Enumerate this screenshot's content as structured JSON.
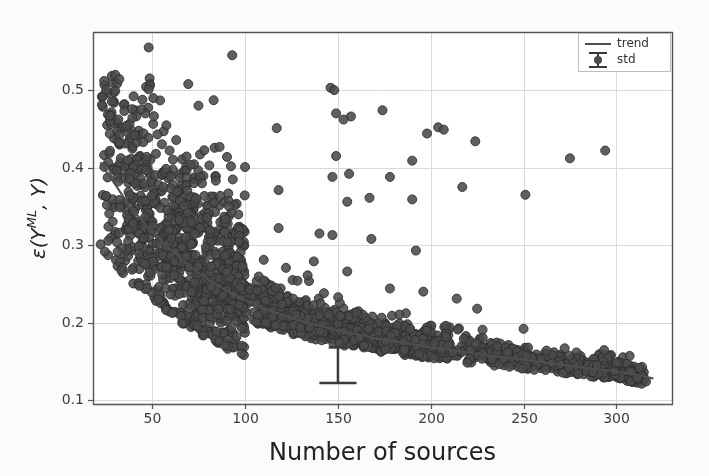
{
  "chart_data": {
    "type": "scatter",
    "title": "",
    "xlabel": "Number of sources",
    "ylabel": "ε(Yᴹᴸ, Y)",
    "ylabel_parts": {
      "epsilon": "ε",
      "open_paren": "(",
      "y_main": "Y",
      "superscript": "ML",
      "comma": ",",
      "y_second": "Y",
      "close_paren": ")"
    },
    "xlim": [
      18,
      330
    ],
    "ylim": [
      0.095,
      0.575
    ],
    "xticks": [
      50,
      100,
      150,
      200,
      250,
      300
    ],
    "xticklabels": [
      "50",
      "100",
      "150",
      "200",
      "250",
      "300"
    ],
    "yticks": [
      0.1,
      0.2,
      0.3,
      0.4,
      0.5
    ],
    "yticklabels": [
      "0.1",
      "0.2",
      "0.3",
      "0.4",
      "0.5"
    ],
    "grid": true,
    "grid_color": "#d9d9d9",
    "axes_color": "#555555",
    "background": "#fbfbfa",
    "marker_face_color": "#4a4a4a",
    "marker_edge_color": "#2e2e2e",
    "marker_size": 9,
    "marker_alpha": 0.88,
    "n_points": 2100,
    "legend": {
      "position": "upper right",
      "entries": [
        {
          "label": "trend",
          "type": "line",
          "color": "#4f4f4f"
        },
        {
          "label": "std",
          "type": "errorbar",
          "color": "#3a3a3a"
        }
      ]
    },
    "trend": {
      "name": "trend",
      "color": "#4f4f4f",
      "linewidth": 2.0,
      "x": [
        22,
        26,
        30,
        35,
        40,
        45,
        50,
        55,
        60,
        65,
        70,
        75,
        80,
        85,
        90,
        95,
        100,
        105,
        110,
        115,
        120,
        125,
        130,
        135,
        140,
        145,
        150,
        155,
        160,
        165,
        170,
        175,
        180,
        185,
        190,
        195,
        200,
        210,
        220,
        230,
        240,
        250,
        260,
        270,
        280,
        290,
        300,
        310,
        320
      ],
      "y": [
        0.407,
        0.392,
        0.378,
        0.36,
        0.344,
        0.33,
        0.317,
        0.305,
        0.294,
        0.283,
        0.273,
        0.264,
        0.256,
        0.248,
        0.241,
        0.235,
        0.229,
        0.224,
        0.219,
        0.214,
        0.21,
        0.206,
        0.202,
        0.199,
        0.196,
        0.193,
        0.19,
        0.187,
        0.185,
        0.183,
        0.18,
        0.178,
        0.176,
        0.174,
        0.172,
        0.17,
        0.168,
        0.165,
        0.161,
        0.158,
        0.155,
        0.152,
        0.149,
        0.146,
        0.143,
        0.14,
        0.137,
        0.133,
        0.128
      ]
    },
    "std_errorbar": {
      "name": "std",
      "x": 150,
      "y": 0.168,
      "yerr_low": 0.046,
      "yerr_high": 0.0,
      "cap_width": 20,
      "color": "#3a3a3a",
      "linewidth": 2.5
    },
    "notable_outliers": [
      {
        "x": 48,
        "y": 0.555
      },
      {
        "x": 93,
        "y": 0.545
      },
      {
        "x": 30,
        "y": 0.499
      },
      {
        "x": 48,
        "y": 0.501
      },
      {
        "x": 146,
        "y": 0.503
      },
      {
        "x": 148,
        "y": 0.5
      },
      {
        "x": 83,
        "y": 0.487
      },
      {
        "x": 174,
        "y": 0.474
      },
      {
        "x": 149,
        "y": 0.47
      },
      {
        "x": 157,
        "y": 0.466
      },
      {
        "x": 153,
        "y": 0.462
      },
      {
        "x": 198,
        "y": 0.444
      },
      {
        "x": 204,
        "y": 0.452
      },
      {
        "x": 207,
        "y": 0.449
      },
      {
        "x": 117,
        "y": 0.451
      },
      {
        "x": 224,
        "y": 0.434
      },
      {
        "x": 294,
        "y": 0.422
      },
      {
        "x": 275,
        "y": 0.412
      },
      {
        "x": 190,
        "y": 0.409
      },
      {
        "x": 149,
        "y": 0.415
      },
      {
        "x": 156,
        "y": 0.392
      },
      {
        "x": 178,
        "y": 0.388
      },
      {
        "x": 147,
        "y": 0.388
      },
      {
        "x": 217,
        "y": 0.375
      },
      {
        "x": 118,
        "y": 0.371
      },
      {
        "x": 251,
        "y": 0.365
      },
      {
        "x": 190,
        "y": 0.359
      },
      {
        "x": 167,
        "y": 0.361
      },
      {
        "x": 155,
        "y": 0.356
      },
      {
        "x": 118,
        "y": 0.322
      },
      {
        "x": 140,
        "y": 0.315
      },
      {
        "x": 147,
        "y": 0.313
      },
      {
        "x": 168,
        "y": 0.308
      },
      {
        "x": 192,
        "y": 0.293
      },
      {
        "x": 110,
        "y": 0.281
      },
      {
        "x": 137,
        "y": 0.279
      },
      {
        "x": 155,
        "y": 0.266
      },
      {
        "x": 178,
        "y": 0.244
      },
      {
        "x": 196,
        "y": 0.24
      },
      {
        "x": 214,
        "y": 0.231
      },
      {
        "x": 225,
        "y": 0.218
      },
      {
        "x": 250,
        "y": 0.192
      },
      {
        "x": 316,
        "y": 0.124
      },
      {
        "x": 300,
        "y": 0.148
      }
    ]
  },
  "axis_labels": {
    "x": "Number of sources",
    "y_full": "ε(Yᴹᴸ, Y)"
  }
}
